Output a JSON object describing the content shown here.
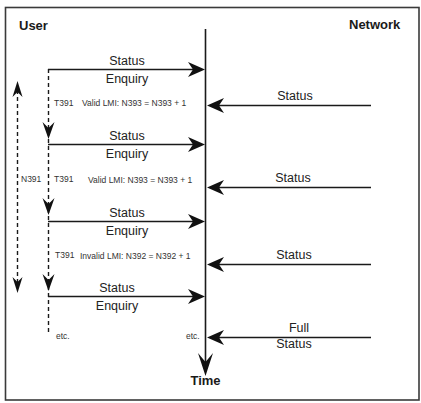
{
  "diagram": {
    "participants": {
      "left": "User",
      "right": "Network"
    },
    "time_axis_label": "Time",
    "messages": [
      {
        "direction": "user-to-network",
        "line1": "Status",
        "line2": "Enquiry"
      },
      {
        "direction": "network-to-user",
        "line1": "Status",
        "line2": ""
      },
      {
        "direction": "user-to-network",
        "line1": "Status",
        "line2": "Enquiry"
      },
      {
        "direction": "network-to-user",
        "line1": "Status",
        "line2": ""
      },
      {
        "direction": "user-to-network",
        "line1": "Status",
        "line2": "Enquiry"
      },
      {
        "direction": "network-to-user",
        "line1": "Status",
        "line2": ""
      },
      {
        "direction": "user-to-network",
        "line1": "Status",
        "line2": "Enquiry"
      },
      {
        "direction": "network-to-user",
        "line1": "Full",
        "line2": "Status"
      }
    ],
    "timers": [
      {
        "label": "T391",
        "note": "Valid LMI: N393 = N393 + 1"
      },
      {
        "label": "T391",
        "note": "Valid LMI: N393 = N393 + 1"
      },
      {
        "label": "T391",
        "note": "Invalid LMI: N392 = N392 + 1"
      }
    ],
    "counter_label": "N391",
    "continuation_left": "etc.",
    "continuation_right": "etc."
  }
}
